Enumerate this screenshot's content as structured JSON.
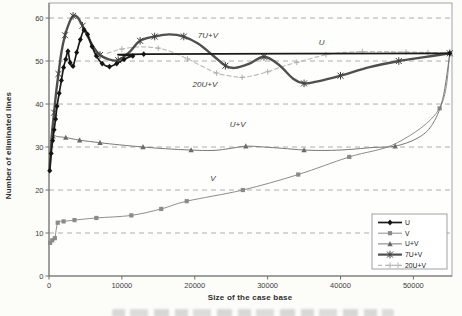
{
  "figure": {
    "width": 462,
    "height": 316,
    "background": "#fcfcf9"
  },
  "style": {
    "frame_color": "#9b9b9b",
    "axis_color": "#6f6f6f",
    "grid_color": "#8d8d8d",
    "tick_text_color": "#3d3d3d",
    "inline_label_color": "#3a3a3a",
    "legend_border_color": "#8a8a8a",
    "legend_bg": "#ffffff",
    "legend_text_color": "#222222"
  },
  "chart_data": {
    "type": "line",
    "title": "",
    "xlabel": "Size of the case base",
    "ylabel": "Number of eliminated lines",
    "xlim": [
      0,
      55300
    ],
    "ylim": [
      0,
      63.5
    ],
    "x_ticks": [
      0,
      10000,
      20000,
      30000,
      40000,
      50000
    ],
    "x_tick_labels": [
      "0",
      "10000",
      "20000",
      "30000",
      "40000",
      "50000"
    ],
    "y_ticks": [
      0,
      10,
      20,
      30,
      40,
      50,
      60
    ],
    "y_tick_labels": [
      "0",
      "10",
      "20",
      "30",
      "40",
      "50",
      "60"
    ],
    "grid": "horizontal-dashed",
    "legend_position": "inside-bottom-right",
    "inline_labels": [
      {
        "text": "7U+V",
        "x": 21800,
        "y": 55.4
      },
      {
        "text": "U",
        "x": 37400,
        "y": 53.7
      },
      {
        "text": "20U+V",
        "x": 21400,
        "y": 44.0
      },
      {
        "text": "U+V",
        "x": 25900,
        "y": 34.7
      },
      {
        "text": "V",
        "x": 22500,
        "y": 22.1
      }
    ],
    "series": [
      {
        "name": "20U+V",
        "legend_index": 4,
        "color": "#bcbcbc",
        "width": 1.2,
        "dash": "4 3",
        "marker": "plus",
        "marker_color": "#b0b0b0",
        "marker_size": 2.8,
        "points": [
          [
            8000,
            51.8
          ],
          [
            10000,
            52.8
          ],
          [
            12500,
            53.3
          ],
          [
            15000,
            53.0
          ],
          [
            17000,
            52.0
          ],
          [
            19000,
            50.5
          ],
          [
            21000,
            48.8
          ],
          [
            23000,
            47.2
          ],
          [
            25000,
            46.5
          ],
          [
            26500,
            46.2
          ],
          [
            28000,
            46.6
          ],
          [
            30000,
            47.5
          ],
          [
            32000,
            48.7
          ],
          [
            34000,
            49.7
          ],
          [
            36000,
            50.6
          ],
          [
            38000,
            51.5
          ],
          [
            40500,
            52.0
          ],
          [
            43000,
            52.2
          ],
          [
            46000,
            52.2
          ],
          [
            49000,
            52.1
          ],
          [
            52000,
            52.0
          ],
          [
            55000,
            51.8
          ]
        ],
        "markers": [
          [
            10000,
            52.8
          ],
          [
            15000,
            53.0
          ],
          [
            19000,
            50.5
          ],
          [
            23000,
            47.2
          ],
          [
            26500,
            46.2
          ],
          [
            30000,
            47.5
          ],
          [
            34000,
            49.7
          ],
          [
            38000,
            51.5
          ],
          [
            43000,
            52.2
          ],
          [
            49000,
            52.1
          ],
          [
            52000,
            52.0
          ]
        ]
      },
      {
        "name": "V",
        "legend_index": 1,
        "color": "#8d8d8d",
        "width": 1.0,
        "dash": null,
        "marker": "square",
        "marker_color": "#8a8a8a",
        "marker_size": 2.1,
        "points": [
          [
            150,
            7.7
          ],
          [
            450,
            8.3
          ],
          [
            800,
            8.8
          ],
          [
            1200,
            12.4
          ],
          [
            2000,
            12.7
          ],
          [
            3500,
            13.0
          ],
          [
            6500,
            13.5
          ],
          [
            11300,
            14.1
          ],
          [
            15400,
            15.6
          ],
          [
            18900,
            17.4
          ],
          [
            26600,
            20.0
          ],
          [
            34200,
            23.6
          ],
          [
            41200,
            27.7
          ],
          [
            47800,
            31.0
          ],
          [
            53600,
            39.0
          ],
          [
            55000,
            51.8
          ]
        ],
        "markers": [
          [
            150,
            7.7
          ],
          [
            450,
            8.3
          ],
          [
            800,
            8.8
          ],
          [
            1200,
            12.4
          ],
          [
            2000,
            12.7
          ],
          [
            3500,
            13.0
          ],
          [
            6500,
            13.5
          ],
          [
            11300,
            14.1
          ],
          [
            15400,
            15.6
          ],
          [
            18900,
            17.4
          ],
          [
            26600,
            20.0
          ],
          [
            34200,
            23.6
          ],
          [
            41200,
            27.7
          ],
          [
            53600,
            39.0
          ]
        ]
      },
      {
        "name": "U+V",
        "legend_index": 2,
        "color": "#787878",
        "width": 1.0,
        "dash": null,
        "marker": "triangle",
        "marker_color": "#6a6a6a",
        "marker_size": 2.3,
        "points": [
          [
            100,
            26.0
          ],
          [
            250,
            29.5
          ],
          [
            550,
            32.5
          ],
          [
            1200,
            32.4
          ],
          [
            2300,
            32.2
          ],
          [
            4200,
            31.6
          ],
          [
            7000,
            31.0
          ],
          [
            9700,
            30.5
          ],
          [
            12900,
            30.0
          ],
          [
            16000,
            29.6
          ],
          [
            19500,
            29.3
          ],
          [
            22500,
            29.2
          ],
          [
            25000,
            29.7
          ],
          [
            27000,
            30.2
          ],
          [
            29500,
            30.0
          ],
          [
            32000,
            29.7
          ],
          [
            35000,
            29.3
          ],
          [
            38000,
            29.2
          ],
          [
            41000,
            29.4
          ],
          [
            44500,
            29.9
          ],
          [
            47500,
            30.2
          ],
          [
            50500,
            32.0
          ],
          [
            52500,
            35.0
          ],
          [
            54000,
            41.0
          ],
          [
            55000,
            51.8
          ]
        ],
        "markers": [
          [
            550,
            32.5
          ],
          [
            2300,
            32.2
          ],
          [
            4200,
            31.6
          ],
          [
            7000,
            31.0
          ],
          [
            12900,
            30.0
          ],
          [
            19500,
            29.3
          ],
          [
            27000,
            30.2
          ],
          [
            35000,
            29.3
          ],
          [
            47500,
            30.2
          ]
        ]
      },
      {
        "name": "7U+V",
        "legend_index": 3,
        "color": "#4f4f4f",
        "width": 2.4,
        "dash": null,
        "marker": "star",
        "marker_color": "#3f3f3f",
        "marker_size": 3.4,
        "points": [
          [
            100,
            25.0
          ],
          [
            400,
            33.0
          ],
          [
            700,
            38.0
          ],
          [
            1000,
            43.0
          ],
          [
            1300,
            47.0
          ],
          [
            1700,
            52.0
          ],
          [
            2200,
            56.0
          ],
          [
            2800,
            59.0
          ],
          [
            3300,
            60.5
          ],
          [
            3900,
            60.2
          ],
          [
            4600,
            58.2
          ],
          [
            5300,
            55.8
          ],
          [
            6100,
            53.2
          ],
          [
            7000,
            51.4
          ],
          [
            8200,
            50.4
          ],
          [
            9500,
            50.2
          ],
          [
            11000,
            52.0
          ],
          [
            12500,
            54.7
          ],
          [
            14500,
            55.7
          ],
          [
            16500,
            56.2
          ],
          [
            18500,
            55.7
          ],
          [
            20500,
            54.0
          ],
          [
            22500,
            51.3
          ],
          [
            24200,
            48.9
          ],
          [
            25500,
            48.4
          ],
          [
            27500,
            49.4
          ],
          [
            29500,
            51.0
          ],
          [
            31500,
            49.2
          ],
          [
            33500,
            45.9
          ],
          [
            35000,
            44.8
          ],
          [
            36700,
            45.2
          ],
          [
            40000,
            46.6
          ],
          [
            44000,
            48.6
          ],
          [
            48000,
            50.0
          ],
          [
            51500,
            50.9
          ],
          [
            55000,
            51.8
          ]
        ],
        "markers": [
          [
            700,
            38.0
          ],
          [
            1300,
            47.0
          ],
          [
            2200,
            56.0
          ],
          [
            3300,
            60.5
          ],
          [
            4600,
            58.2
          ],
          [
            7000,
            51.4
          ],
          [
            9500,
            50.2
          ],
          [
            12500,
            54.7
          ],
          [
            14500,
            55.7
          ],
          [
            18500,
            55.7
          ],
          [
            24200,
            48.9
          ],
          [
            29500,
            51.0
          ],
          [
            35000,
            44.8
          ],
          [
            40000,
            46.6
          ],
          [
            48000,
            50.0
          ],
          [
            55000,
            51.8
          ]
        ]
      },
      {
        "name": "U",
        "legend_index": 0,
        "color": "#1a1a1a",
        "width": 1.7,
        "dash": null,
        "marker": "diamond",
        "marker_color": "#141414",
        "marker_size": 2.5,
        "points": [
          [
            100,
            24.5
          ],
          [
            300,
            28.5
          ],
          [
            500,
            31.5
          ],
          [
            700,
            34.0
          ],
          [
            900,
            36.5
          ],
          [
            1100,
            39.5
          ],
          [
            1400,
            42.5
          ],
          [
            1700,
            45.5
          ],
          [
            2000,
            48.5
          ],
          [
            2300,
            50.4
          ],
          [
            2600,
            52.3
          ],
          [
            2900,
            49.6
          ],
          [
            3300,
            48.8
          ],
          [
            3800,
            52.0
          ],
          [
            4300,
            55.0
          ],
          [
            4800,
            57.2
          ],
          [
            5300,
            56.2
          ],
          [
            5900,
            53.4
          ],
          [
            6500,
            51.2
          ],
          [
            7300,
            49.4
          ],
          [
            8300,
            48.7
          ],
          [
            9300,
            49.4
          ],
          [
            10300,
            50.4
          ],
          [
            11500,
            51.2
          ],
          [
            13000,
            51.6
          ],
          [
            55000,
            51.8
          ]
        ],
        "markers": [
          [
            100,
            24.5
          ],
          [
            300,
            28.5
          ],
          [
            500,
            31.5
          ],
          [
            700,
            34.0
          ],
          [
            900,
            36.5
          ],
          [
            1100,
            39.5
          ],
          [
            1400,
            42.5
          ],
          [
            1700,
            45.5
          ],
          [
            2000,
            48.5
          ],
          [
            2300,
            50.4
          ],
          [
            2600,
            52.3
          ],
          [
            2900,
            49.6
          ],
          [
            3300,
            48.8
          ],
          [
            3800,
            52.0
          ],
          [
            4300,
            55.0
          ],
          [
            4800,
            57.2
          ],
          [
            5300,
            56.2
          ],
          [
            5900,
            53.4
          ],
          [
            6500,
            51.2
          ],
          [
            7300,
            49.4
          ],
          [
            8300,
            48.7
          ],
          [
            9300,
            49.4
          ],
          [
            10300,
            50.4
          ],
          [
            11500,
            51.2
          ],
          [
            13000,
            51.6
          ],
          [
            55000,
            51.8
          ]
        ]
      }
    ],
    "legend_items": [
      "U",
      "V",
      "U+V",
      "7U+V",
      "20U+V"
    ]
  }
}
